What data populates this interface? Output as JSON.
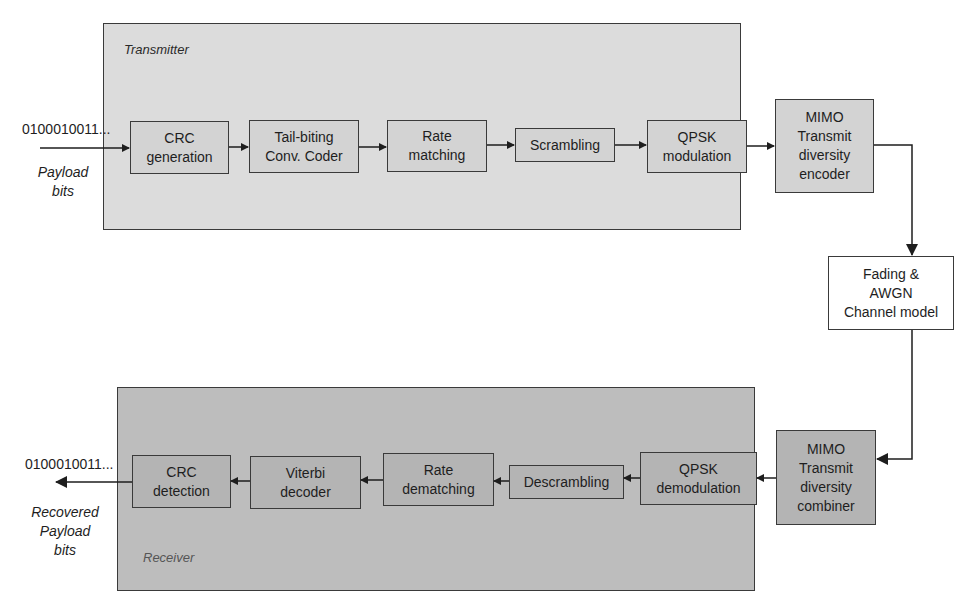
{
  "transmitter": {
    "label": "Transmitter",
    "input_bits": "0100010011...",
    "input_caption": "Payload\nbits",
    "blocks": [
      {
        "label": "CRC\ngeneration"
      },
      {
        "label": "Tail-biting\nConv. Coder"
      },
      {
        "label": "Rate\nmatching"
      },
      {
        "label": "Scrambling"
      },
      {
        "label": "QPSK\nmodulation"
      },
      {
        "label": "MIMO\nTransmit\ndiversity\nencoder"
      }
    ]
  },
  "channel": {
    "label": "Fading &\nAWGN\nChannel model"
  },
  "receiver": {
    "label": "Receiver",
    "output_bits": "0100010011...",
    "output_caption": "Recovered\nPayload\nbits",
    "blocks": [
      {
        "label": "CRC\ndetection"
      },
      {
        "label": "Viterbi\ndecoder"
      },
      {
        "label": "Rate\ndematching"
      },
      {
        "label": "Descrambling"
      },
      {
        "label": "QPSK\ndemodulation"
      },
      {
        "label": "MIMO\nTransmit\ndiversity\ncombiner"
      }
    ]
  },
  "colors": {
    "transmitter_bg": "#dcdcdc",
    "receiver_bg": "#bdbdbd",
    "channel_bg": "#ffffff",
    "line": "#1e1e1e"
  }
}
